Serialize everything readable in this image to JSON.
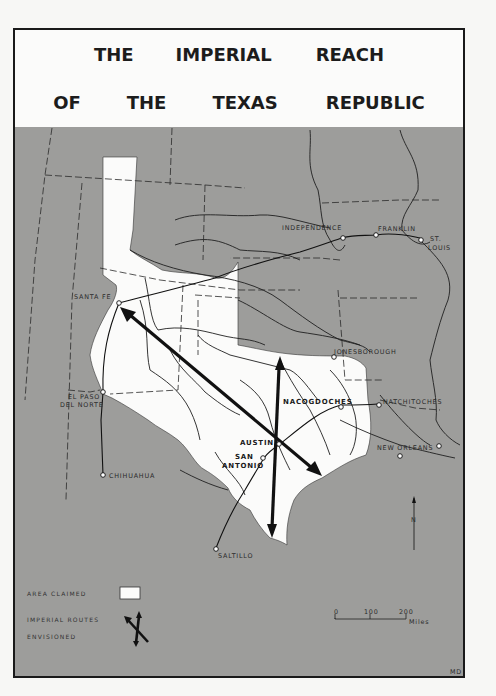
{
  "title": {
    "line1": [
      "THE",
      "IMPERIAL",
      "REACH"
    ],
    "line2": [
      "OF",
      "THE",
      "TEXAS",
      "REPUBLIC"
    ]
  },
  "places": {
    "independence": "INDEPENDENCE",
    "franklin": "FRANKLIN",
    "st_louis_1": "ST.",
    "st_louis_2": "LOUIS",
    "santa_fe": "SANTA FE",
    "jonesborough": "JONESBOROUGH",
    "el_paso_1": "EL PASO",
    "el_paso_2": "DEL NORTE",
    "nacogdoches": "NACOGDOCHES",
    "natchitoches": "NATCHITOCHES",
    "austin": "AUSTIN",
    "san_antonio_1": "SAN",
    "san_antonio_2": "ANTONIO",
    "new_orleans": "NEW ORLEANS",
    "chihuahua": "CHIHUAHUA",
    "saltillo": "SALTILLO"
  },
  "legend": {
    "area_claimed": "AREA CLAIMED",
    "routes_1": "IMPERIAL ROUTES",
    "routes_2": "ENVISIONED"
  },
  "scale": {
    "ticks": [
      "0",
      "100",
      "200"
    ],
    "unit": "Miles"
  },
  "north_label": "N",
  "credit": "MD",
  "colors": {
    "land": "#9d9d9b",
    "claimed": "#fbfbfa",
    "lines": "#1a1a1a"
  }
}
